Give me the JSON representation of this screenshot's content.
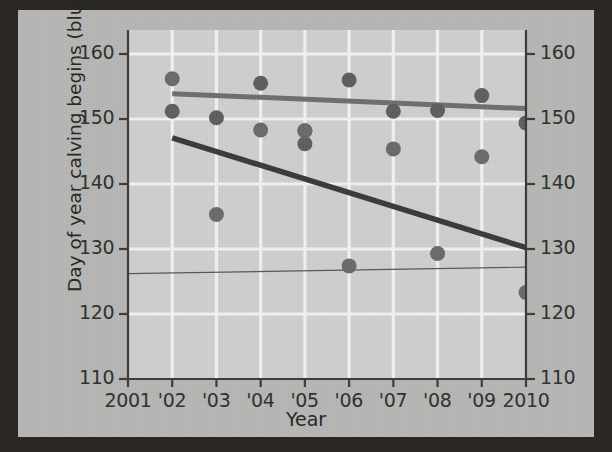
{
  "chart_data": {
    "type": "scatter",
    "title": "",
    "xlabel": "Year",
    "ylabel_left": "Day of year calving begins (blue)",
    "ylabel_right": "Day of year plant growth begins (red)",
    "xlim": [
      2001,
      2010
    ],
    "ylim": [
      110,
      160
    ],
    "grid": true,
    "legend_position": "none",
    "x_tick_labels": [
      "2001",
      "'02",
      "'03",
      "'04",
      "'05",
      "'06",
      "'07",
      "'08",
      "'09",
      "2010"
    ],
    "x_tick_values": [
      2001,
      2002,
      2003,
      2004,
      2005,
      2006,
      2007,
      2008,
      2009,
      2010
    ],
    "y_tick_labels_left": [
      "160",
      "150",
      "140",
      "130",
      "120",
      "110"
    ],
    "y_tick_labels_right": [
      "160",
      "150",
      "140",
      "130",
      "120",
      "110"
    ],
    "y_tick_values": [
      160,
      150,
      140,
      130,
      120,
      110
    ],
    "series": [
      {
        "name": "Day of year calving begins (blue)",
        "color": "#5e5e5e",
        "marker": "circle",
        "x": [
          2002,
          2003,
          2004,
          2005,
          2005,
          2006,
          2007,
          2008,
          2009,
          2010
        ],
        "values": [
          151.2,
          150.2,
          155.5,
          148.2,
          146.2,
          156.0,
          151.2,
          151.3,
          153.6,
          149.4
        ]
      },
      {
        "name": "Day of year plant growth begins (red)",
        "color": "#6a6a6a",
        "marker": "circle",
        "x": [
          2002,
          2003,
          2004,
          2005,
          2006,
          2007,
          2008,
          2009,
          2010
        ],
        "values": [
          156.2,
          135.3,
          148.3,
          148.2,
          127.4,
          145.4,
          129.3,
          144.2,
          123.3
        ]
      }
    ],
    "trend_lines": [
      {
        "name": "calving-trend-line",
        "color": "#6e6e6e",
        "width": 5,
        "x0": 2002,
        "y0": 153.9,
        "x1": 2010,
        "y1": 151.6
      },
      {
        "name": "plant-growth-trend-line",
        "color": "#3a3a3a",
        "width": 5.5,
        "x0": 2002,
        "y0": 147.1,
        "x1": 2010,
        "y1": 130.2
      },
      {
        "name": "thin-reference-line",
        "color": "#575757",
        "width": 1.2,
        "x0": 2001,
        "y0": 126.2,
        "x1": 2010,
        "y1": 127.2
      }
    ]
  }
}
